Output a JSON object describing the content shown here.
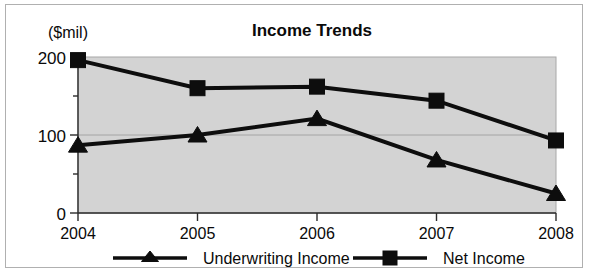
{
  "chart_data": {
    "type": "line",
    "title": "Income Trends",
    "xlabel": "",
    "ylabel": "($mil)",
    "ylim": [
      0,
      200
    ],
    "yticks": [
      0,
      100,
      200
    ],
    "ytick_labels": [
      "0",
      "100",
      "200"
    ],
    "yminor_ticks": [
      50,
      150
    ],
    "grid": true,
    "legend_position": "bottom",
    "categories": [
      "2004",
      "2005",
      "2006",
      "2007",
      "2008"
    ],
    "series": [
      {
        "name": "Underwriting Income",
        "marker": "triangle",
        "values": [
          87,
          100,
          121,
          68,
          25
        ]
      },
      {
        "name": "Net Income",
        "marker": "square",
        "values": [
          196,
          160,
          162,
          144,
          93
        ]
      }
    ],
    "colors": {
      "series_line": "#0d0d0d",
      "plot_background": "#d3d3d3",
      "frame_border": "#b0b0b0",
      "page_background": "#ffffff",
      "axis": "#2b2b2b",
      "gridline": "#9a9a9a"
    }
  },
  "axis": {
    "unit_label": "($mil)",
    "y_tick_0": "0",
    "y_tick_100": "100",
    "y_tick_200": "200",
    "x_tick_0": "2004",
    "x_tick_1": "2005",
    "x_tick_2": "2006",
    "x_tick_3": "2007",
    "x_tick_4": "2008"
  },
  "title": {
    "text": "Income Trends"
  },
  "legend": {
    "items": [
      {
        "label": "Underwriting Income",
        "marker": "triangle-marker"
      },
      {
        "label": "Net Income",
        "marker": "square-marker"
      }
    ]
  }
}
